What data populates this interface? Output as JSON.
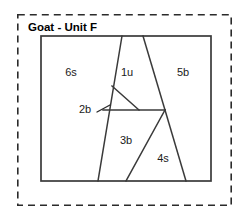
{
  "figure": {
    "title": "Goat - Unit F",
    "title_position": {
      "x": 28,
      "y": 31
    },
    "colors": {
      "line": "#3a3a3a",
      "dashed_border": "#2b2b2b",
      "background": "#ffffff",
      "text": "#1a1a1a"
    },
    "outer_border": {
      "name": "dashed-selection-border",
      "x": 17,
      "y": 14,
      "width": 215,
      "height": 192,
      "style": "dashed"
    },
    "plot_area": {
      "name": "unit-boundary-rectangle",
      "x": 41,
      "y": 36,
      "width": 170,
      "height": 145
    },
    "regions": [
      {
        "id": "6s",
        "label": "6s",
        "x": 71,
        "y": 76
      },
      {
        "id": "1u",
        "label": "1u",
        "x": 127,
        "y": 76
      },
      {
        "id": "5b",
        "label": "5b",
        "x": 183,
        "y": 76
      },
      {
        "id": "2b",
        "label": "2b",
        "x": 85,
        "y": 113
      },
      {
        "id": "3b",
        "label": "3b",
        "x": 126,
        "y": 144
      },
      {
        "id": "4s",
        "label": "4s",
        "x": 163,
        "y": 162
      }
    ],
    "partitions": [
      {
        "name": "divider-left-diagonal",
        "d": "M 122 36 L 98 181"
      },
      {
        "name": "divider-right-diagonal",
        "d": "M 143 36 L 165 110"
      },
      {
        "name": "divider-right-lower-diagonal",
        "d": "M 165 110 L 186 181"
      },
      {
        "name": "divider-horizontal",
        "d": "M 103 110 L 165 110"
      },
      {
        "name": "divider-small-triangle-hypotenuse",
        "d": "M 112 86 L 139 110"
      },
      {
        "name": "divider-inner-diagonal",
        "d": "M 165 110 L 126 181"
      }
    ],
    "leader": {
      "name": "label-2b-leader-line",
      "d": "M 97 112 L 110 105"
    }
  }
}
